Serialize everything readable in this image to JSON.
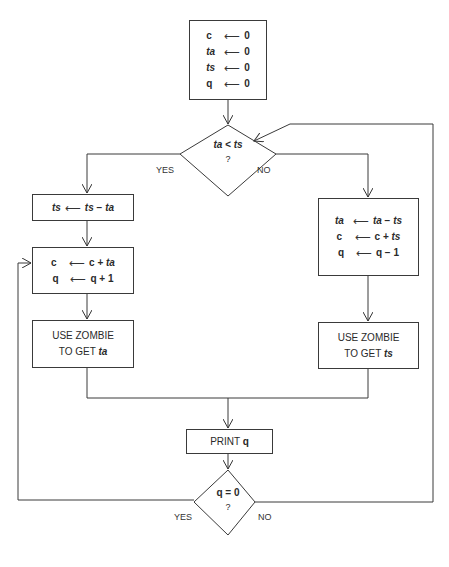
{
  "diagram": {
    "type": "flowchart",
    "arrow_symbol": "⟵",
    "init_box": {
      "rows": [
        {
          "lhs": "c",
          "rhs": "0"
        },
        {
          "lhs": "ta",
          "rhs": "0"
        },
        {
          "lhs": "ts",
          "rhs": "0"
        },
        {
          "lhs": "q",
          "rhs": "0"
        }
      ]
    },
    "decision_1": {
      "condition": "ta < ts",
      "question": "?",
      "yes_label": "YES",
      "no_label": "NO"
    },
    "left_branch": {
      "box_1": {
        "lhs": "ts",
        "rhs_a": "ts",
        "op": "−",
        "rhs_b": "ta"
      },
      "box_2": {
        "rows": [
          {
            "lhs": "c",
            "rhs_a": "c",
            "op": "+",
            "rhs_b": "ta"
          },
          {
            "lhs": "q",
            "rhs_a": "q",
            "op": "+",
            "rhs_b": "1"
          }
        ]
      },
      "box_3": {
        "line1": "USE ZOMBIE",
        "line2_prefix": "TO GET",
        "line2_var": "ta"
      }
    },
    "right_branch": {
      "box_1": {
        "rows": [
          {
            "lhs": "ta",
            "rhs_a": "ta",
            "op": "−",
            "rhs_b": "ts"
          },
          {
            "lhs": "c",
            "rhs_a": "c",
            "op": "+",
            "rhs_b": "ts"
          },
          {
            "lhs": "q",
            "rhs_a": "q",
            "op": "−",
            "rhs_b": "1"
          }
        ]
      },
      "box_2": {
        "line1": "USE ZOMBIE",
        "line2_prefix": "TO GET",
        "line2_var": "ts"
      }
    },
    "print_box": {
      "prefix": "PRINT",
      "var": "q"
    },
    "decision_2": {
      "condition_lhs": "q",
      "condition_op": "=",
      "condition_rhs": "0",
      "question": "?",
      "yes_label": "YES",
      "no_label": "NO"
    }
  }
}
